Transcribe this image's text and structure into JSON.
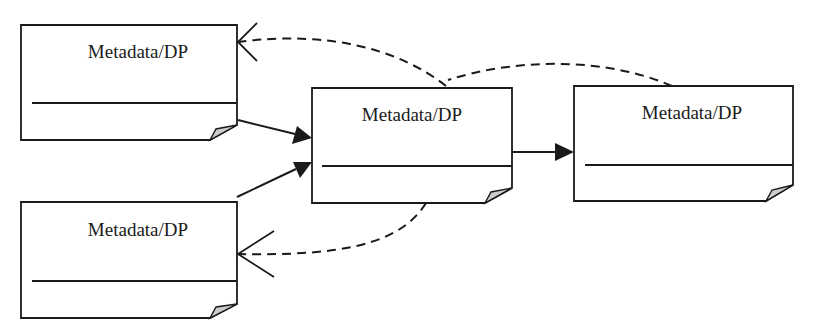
{
  "diagram": {
    "colors": {
      "stroke": "#1a1a1a",
      "fold": "#cccccc",
      "background": "#ffffff"
    },
    "nodes": [
      {
        "id": "top-left",
        "label": "Metadata/DP"
      },
      {
        "id": "bottom-left",
        "label": "Metadata/DP"
      },
      {
        "id": "center",
        "label": "Metadata/DP"
      },
      {
        "id": "right",
        "label": "Metadata/DP"
      }
    ],
    "edges": [
      {
        "from": "top-left",
        "to": "center",
        "style": "solid",
        "arrowhead": "filled-triangle"
      },
      {
        "from": "bottom-left",
        "to": "center",
        "style": "solid",
        "arrowhead": "filled-triangle"
      },
      {
        "from": "center",
        "to": "right",
        "style": "solid",
        "arrowhead": "filled-triangle"
      },
      {
        "from": "center",
        "to": "top-left",
        "style": "dashed",
        "arrowhead": "open"
      },
      {
        "from": "right",
        "to": "top-left",
        "style": "dashed",
        "arrowhead": "open"
      },
      {
        "from": "center",
        "to": "bottom-left",
        "style": "dashed",
        "arrowhead": "open"
      }
    ]
  }
}
